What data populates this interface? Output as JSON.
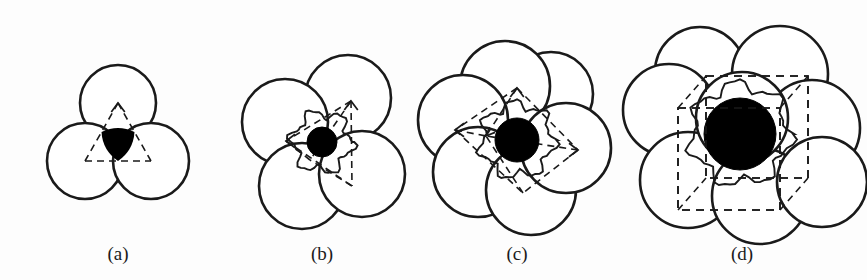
{
  "figure": {
    "background_color": "#fdfdfd",
    "stroke_color": "#1a1a1a",
    "fill_color": "#ffffff",
    "sphere_color": "#000000",
    "caption_font_size": 19
  },
  "panels": [
    {
      "id": "a",
      "label": "(a)",
      "label_x": 118,
      "label_y": 255,
      "coordination_number": 3,
      "geometry": "triangular",
      "polyhedron": "triangle",
      "sphere_radius": 0,
      "anion_radius": 38,
      "center": {
        "x": 118,
        "y": 141
      },
      "anions": [
        {
          "x": 118,
          "y": 103,
          "r": 38
        },
        {
          "x": 85,
          "y": 161,
          "r": 38
        },
        {
          "x": 151,
          "y": 161,
          "r": 38
        }
      ],
      "dashed_edges": [
        {
          "x1": 118,
          "y1": 103,
          "x2": 85,
          "y2": 161
        },
        {
          "x1": 118,
          "y1": 103,
          "x2": 151,
          "y2": 161
        },
        {
          "x1": 85,
          "y1": 161,
          "x2": 151,
          "y2": 161
        }
      ],
      "void_fill": true
    },
    {
      "id": "b",
      "label": "(b)",
      "label_x": 322,
      "label_y": 255,
      "coordination_number": 4,
      "geometry": "tetrahedral",
      "polyhedron": "tetrahedron",
      "sphere_radius": 15,
      "anion_radius": 43,
      "center": {
        "x": 322,
        "y": 142
      },
      "anions": [
        {
          "x": 348,
          "y": 98,
          "r": 43
        },
        {
          "x": 285,
          "y": 122,
          "r": 43
        },
        {
          "x": 302,
          "y": 186,
          "r": 43
        },
        {
          "x": 362,
          "y": 174,
          "r": 43
        }
      ],
      "dashed_edges": [
        {
          "x1": 351,
          "y1": 101,
          "x2": 286,
          "y2": 141
        },
        {
          "x1": 351,
          "y1": 101,
          "x2": 352,
          "y2": 186
        },
        {
          "x1": 286,
          "y1": 141,
          "x2": 352,
          "y2": 186
        },
        {
          "x1": 351,
          "y1": 101,
          "x2": 310,
          "y2": 160
        },
        {
          "x1": 286,
          "y1": 141,
          "x2": 310,
          "y2": 160
        },
        {
          "x1": 352,
          "y1": 186,
          "x2": 310,
          "y2": 160
        }
      ],
      "arrow_vertices": [
        {
          "x": 286,
          "y": 141,
          "dir": "left"
        },
        {
          "x": 351,
          "y": 101,
          "dir": "up"
        }
      ]
    },
    {
      "id": "c",
      "label": "(c)",
      "label_x": 517,
      "label_y": 255,
      "coordination_number": 6,
      "geometry": "octahedral",
      "polyhedron": "octahedron",
      "sphere_radius": 22,
      "anion_radius": 45,
      "center": {
        "x": 517,
        "y": 140
      },
      "anions": [
        {
          "x": 551,
          "y": 94,
          "r": 42
        },
        {
          "x": 505,
          "y": 86,
          "r": 45
        },
        {
          "x": 463,
          "y": 120,
          "r": 45
        },
        {
          "x": 478,
          "y": 172,
          "r": 45
        },
        {
          "x": 531,
          "y": 190,
          "r": 45
        },
        {
          "x": 566,
          "y": 148,
          "r": 45
        }
      ],
      "dashed_edges": [
        {
          "x1": 517,
          "y1": 88,
          "x2": 455,
          "y2": 130
        },
        {
          "x1": 517,
          "y1": 88,
          "x2": 578,
          "y2": 150
        },
        {
          "x1": 455,
          "y1": 130,
          "x2": 523,
          "y2": 193
        },
        {
          "x1": 578,
          "y1": 150,
          "x2": 523,
          "y2": 193
        },
        {
          "x1": 517,
          "y1": 88,
          "x2": 486,
          "y2": 136
        },
        {
          "x1": 455,
          "y1": 130,
          "x2": 486,
          "y2": 136
        },
        {
          "x1": 578,
          "y1": 150,
          "x2": 486,
          "y2": 136
        },
        {
          "x1": 523,
          "y1": 193,
          "x2": 486,
          "y2": 136
        }
      ],
      "arrow_vertices": [
        {
          "x": 455,
          "y": 130,
          "dir": "left"
        },
        {
          "x": 517,
          "y": 88,
          "dir": "up"
        },
        {
          "x": 578,
          "y": 150,
          "dir": "right"
        },
        {
          "x": 486,
          "y": 136,
          "dir": "leftdown"
        }
      ]
    },
    {
      "id": "d",
      "label": "(d)",
      "label_x": 742,
      "label_y": 255,
      "coordination_number": 8,
      "geometry": "cubic",
      "polyhedron": "cube",
      "sphere_radius": 36,
      "anion_radius": 48,
      "center": {
        "x": 740,
        "y": 134
      },
      "anions": [
        {
          "x": 700,
          "y": 72,
          "r": 45
        },
        {
          "x": 780,
          "y": 74,
          "r": 48
        },
        {
          "x": 669,
          "y": 110,
          "r": 46
        },
        {
          "x": 812,
          "y": 128,
          "r": 48
        },
        {
          "x": 688,
          "y": 180,
          "r": 48
        },
        {
          "x": 760,
          "y": 196,
          "r": 48
        },
        {
          "x": 822,
          "y": 182,
          "r": 45
        },
        {
          "x": 742,
          "y": 118,
          "r": 46
        }
      ],
      "cube_front": {
        "x": 678,
        "y": 108,
        "w": 102,
        "h": 102
      },
      "cube_back": {
        "x": 706,
        "y": 76,
        "w": 102,
        "h": 102
      },
      "dashed_edges": [
        {
          "x1": 678,
          "y1": 108,
          "x2": 706,
          "y2": 76
        },
        {
          "x1": 780,
          "y1": 108,
          "x2": 808,
          "y2": 76
        },
        {
          "x1": 678,
          "y1": 210,
          "x2": 706,
          "y2": 178
        },
        {
          "x1": 780,
          "y1": 210,
          "x2": 808,
          "y2": 178
        }
      ]
    }
  ]
}
